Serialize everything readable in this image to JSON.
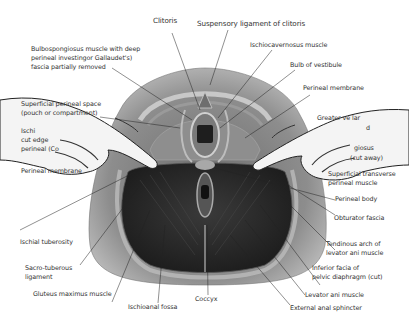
{
  "figure": {
    "background": "#ffffff",
    "label_color": "#333333",
    "tissue_colors": {
      "outer_skin": "#9a9a9a",
      "muscle_dark": "#2b2b2b",
      "fascia_light": "#c9c9c9",
      "hand_fill": "#f4f4f4"
    }
  },
  "labels": {
    "clitoris": "Clitoris",
    "suspensory_ligament": "Suspensory ligament of clitoris",
    "bulbospongiosus_1": "Bulbospongiosus muscle with deep",
    "bulbospongiosus_2": "perineal investingor Gallaudet's)",
    "bulbospongiosus_3": "fascia partially removed",
    "ischiocavernosus": "Ischiocavernosus muscle",
    "bulb_vestibule": "Bulb of vestibule",
    "perineal_membrane_right": "Perineal membrane",
    "superficial_space_1": "Superficial perineal space",
    "superficial_space_2": "(pouch or compartment)",
    "ischio_cut_1": "Ischi",
    "ischio_cut_2": "cut edge",
    "ischio_cut_3": "perineal (Co",
    "greater_vestibular_1": "Greater ve    lar",
    "greater_vestibular_2": "d",
    "bulbo_cut_1": "giosus",
    "bulbo_cut_2": "(cut away)",
    "perineal_membrane_left": "Perineal membrane",
    "superficial_transverse_1": "Superficial transverse",
    "superficial_transverse_2": "perineal muscle",
    "perineal_body": "Perineal body",
    "obturator_fascia": "Obturator fascia",
    "ischial_tuberosity": "Ischial tuberosity",
    "tendinous_arch_1": "Tendinous arch of",
    "tendinous_arch_2": "levator ani muscle",
    "sacro_tuberous_1": "Sacro-tuberous",
    "sacro_tuberous_2": "ligament",
    "inferior_fascia_1": "Inferior facia of",
    "inferior_fascia_2": "pelvic diaphragm (cut)",
    "gluteus_maximus": "Gluteus maximus muscle",
    "levator_ani": "Levator ani muscle",
    "ischioanal_fossa": "Ischioanal fossa",
    "coccyx": "Coccyx",
    "external_anal_sphincter": "External anal sphincter"
  }
}
